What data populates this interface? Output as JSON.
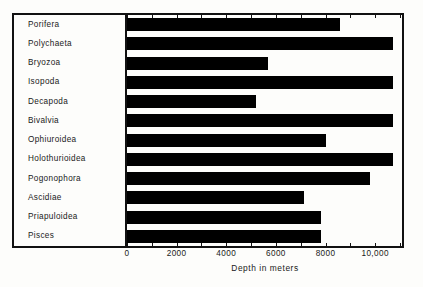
{
  "chart_data": {
    "type": "bar",
    "orientation": "horizontal",
    "title": "",
    "xlabel": "Depth in meters",
    "ylabel": "",
    "xlim": [
      0,
      11080
    ],
    "xticks": [
      0,
      1000,
      2000,
      3000,
      4000,
      5000,
      6000,
      7000,
      8000,
      9000,
      10000,
      11000
    ],
    "xtick_labels": [
      "0",
      "2000",
      "4000",
      "6000",
      "8000",
      "10,000"
    ],
    "xtick_label_values": [
      0,
      2000,
      4000,
      6000,
      8000,
      10000
    ],
    "grid": false,
    "legend": null,
    "bar_color": "#000000",
    "categories": [
      "Porifera",
      "Polychaeta",
      "Bryozoa",
      "Isopoda",
      "Decapoda",
      "Bivalvia",
      "Ophiuroidea",
      "Holothurioidea",
      "Pogonophora",
      "Ascidiae",
      "Priapuloidea",
      "Pisces"
    ],
    "values": [
      8600,
      10700,
      5700,
      10700,
      5200,
      10700,
      8000,
      10700,
      9800,
      7150,
      7800,
      7800
    ]
  },
  "axis": {
    "title": "Depth in meters",
    "labels": [
      "0",
      "2000",
      "4000",
      "6000",
      "8000",
      "10,000"
    ]
  },
  "categories": {
    "items": [
      {
        "label": "Porifera"
      },
      {
        "label": "Polychaeta"
      },
      {
        "label": "Bryozoa"
      },
      {
        "label": "Isopoda"
      },
      {
        "label": "Decapoda"
      },
      {
        "label": "Bivalvia"
      },
      {
        "label": "Ophiuroidea"
      },
      {
        "label": "Holothurioidea"
      },
      {
        "label": "Pogonophora"
      },
      {
        "label": "Ascidiae"
      },
      {
        "label": "Priapuloidea"
      },
      {
        "label": "Pisces"
      }
    ]
  }
}
